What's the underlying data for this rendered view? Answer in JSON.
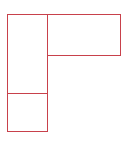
{
  "diagram": {
    "stroke_color": "#c8414b",
    "background": "#ffffff",
    "shapes": [
      {
        "id": "left-tall-rect",
        "type": "rect",
        "x": 7,
        "y": 14,
        "w": 41,
        "h": 80
      },
      {
        "id": "bottom-left-rect",
        "type": "rect",
        "x": 7,
        "y": 93,
        "w": 41,
        "h": 39
      },
      {
        "id": "top-right-rect",
        "type": "rect",
        "x": 47,
        "y": 14,
        "w": 74,
        "h": 42
      }
    ]
  }
}
